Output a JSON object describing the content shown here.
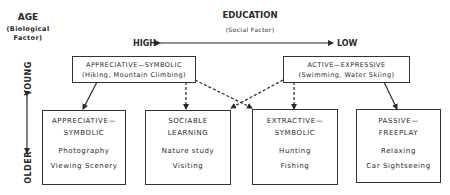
{
  "age": {
    "title": "AGE",
    "subtitle_line1": "(Biological",
    "subtitle_line2": "Factor)",
    "young": "YOUNG",
    "older": "OLDER"
  },
  "education": {
    "title": "EDUCATION",
    "subtitle": "(Social Factor)",
    "high": "HIGH",
    "low": "LOW"
  },
  "top_boxes": [
    {
      "title": "APPRECIATIVE—SYMBOLIC",
      "examples": "(Hiking, Mountain Climbing)"
    },
    {
      "title": "ACTIVE—EXPRESSIVE",
      "examples": "(Swimming, Water Skiing)"
    }
  ],
  "bottom_boxes": [
    {
      "title_line1": "APPRECIATIVE—",
      "title_line2": "SYMBOLIC",
      "example1": "Photography",
      "example2": "Viewing Scenery"
    },
    {
      "title_line1": "SOCIABLE",
      "title_line2": "LEARNING",
      "example1": "Nature study",
      "example2": "Visiting"
    },
    {
      "title_line1": "EXTRACTIVE—",
      "title_line2": "SYMBOLIC",
      "example1": "Hunting",
      "example2": "Fishing"
    },
    {
      "title_line1": "PASSIVE—",
      "title_line2": "FREEPLAY",
      "example1": "Relaxing",
      "example2": "Car Sightseeing"
    }
  ],
  "colors": {
    "ink": "#2a2a2a",
    "background": "#ffffff"
  }
}
